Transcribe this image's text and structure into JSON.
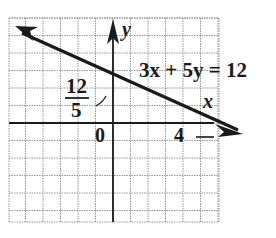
{
  "chart_data": {
    "type": "line",
    "title": "",
    "equation": "3x + 5y = 12",
    "xlabel": "x",
    "ylabel": "y",
    "xlim": [
      -6,
      6
    ],
    "ylim": [
      -5.7,
      6
    ],
    "grid": true,
    "grid_step": 1,
    "origin_label": "0",
    "annotations": [
      {
        "text": "12/5",
        "numerator": "12",
        "denominator": "5",
        "point": [
          0,
          2.4
        ],
        "role": "y-intercept"
      },
      {
        "text": "4",
        "point": [
          4,
          0
        ],
        "role": "x-intercept"
      },
      {
        "text": "3x + 5y = 12",
        "role": "line-label"
      }
    ],
    "series": [
      {
        "name": "3x + 5y = 12",
        "slope": -0.6,
        "intercept": 2.4,
        "x": [
          -5.8,
          0,
          4,
          5.8
        ],
        "y": [
          5.88,
          2.4,
          0,
          -1.08
        ],
        "arrows_both_ends": true
      }
    ]
  },
  "labels": {
    "equation": "3x + 5y = 12",
    "x_axis": "x",
    "y_axis": "y",
    "origin": "0",
    "x_intercept": "4",
    "y_intercept_num": "12",
    "y_intercept_den": "5"
  },
  "colors": {
    "ink": "#1a1a1a",
    "grid": "#8a8a8a",
    "background": "#ffffff"
  }
}
